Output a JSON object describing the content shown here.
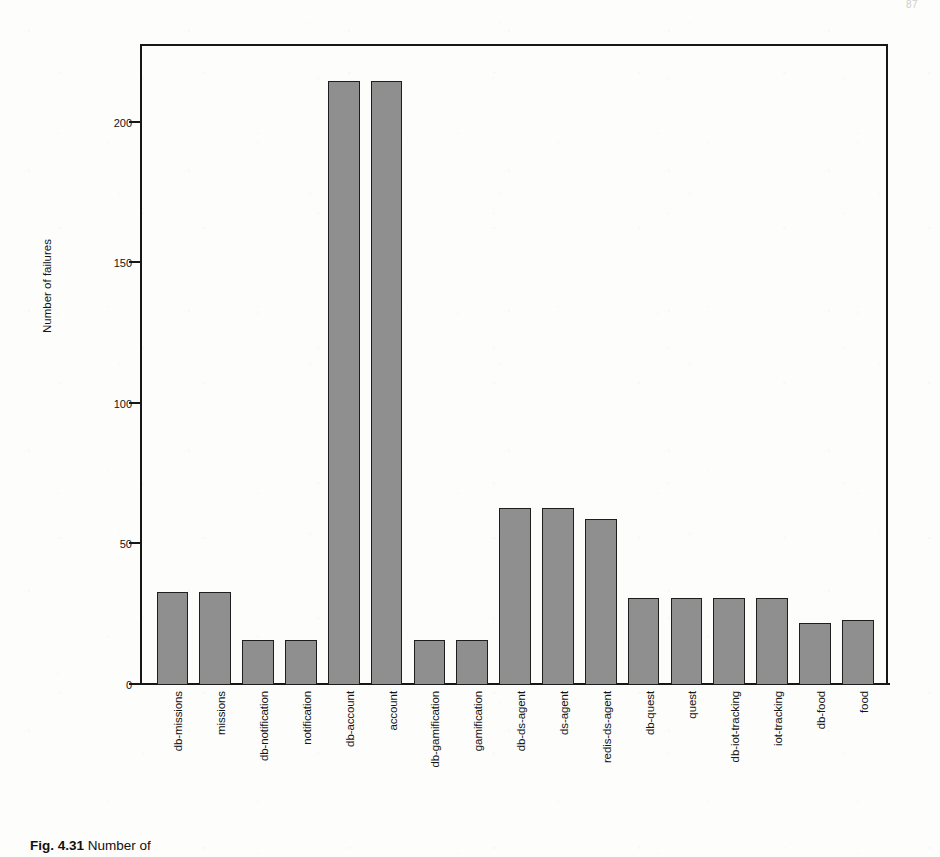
{
  "page": {
    "page_number": "87",
    "caption_figure_number": "Fig. 4.31",
    "caption_text": "Number of"
  },
  "chart_data": {
    "type": "bar",
    "title": "",
    "subtitle": "",
    "xlabel": "",
    "ylabel": "Number of failures",
    "ylim": [
      0,
      228
    ],
    "yticks": [
      0,
      50,
      100,
      150,
      200
    ],
    "ytick_labels": [
      "0",
      "50",
      "100",
      "150",
      "200"
    ],
    "grid": false,
    "legend": null,
    "bar_color": "#8f8f8f",
    "bar_edge_color": "#1e1e1e",
    "axis_color": "#171717",
    "categories": [
      "db-missions",
      "missions",
      "db-notification",
      "notification",
      "db-account",
      "account",
      "db-gamification",
      "gamification",
      "db-ds-agent",
      "ds-agent",
      "redis-ds-agent",
      "db-quest",
      "quest",
      "db-iot-tracking",
      "iot-tracking",
      "db-food",
      "food"
    ],
    "values": [
      33,
      33,
      16,
      16,
      215,
      215,
      16,
      16,
      63,
      63,
      59,
      31,
      31,
      31,
      31,
      22,
      23
    ]
  }
}
